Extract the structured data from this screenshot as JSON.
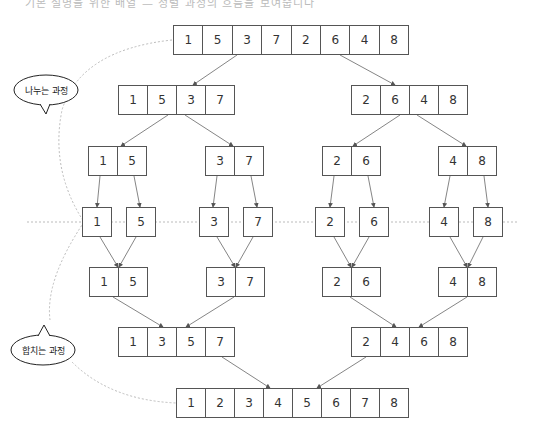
{
  "header_fragment": "기본 설명을 위한 배열 — 정렬 과정의 흐름을 보여줍니다",
  "labels": {
    "divide": "나누는 과정",
    "merge": "합치는 과정"
  },
  "levels": [
    {
      "y": 25,
      "groups": [
        {
          "x": 173,
          "w": 29.4,
          "values": [
            1,
            5,
            3,
            7,
            2,
            6,
            4,
            8
          ]
        }
      ]
    },
    {
      "y": 85,
      "groups": [
        {
          "x": 118,
          "w": 29,
          "values": [
            1,
            5,
            3,
            7
          ]
        },
        {
          "x": 351,
          "w": 29,
          "values": [
            2,
            6,
            4,
            8
          ]
        }
      ]
    },
    {
      "y": 146,
      "groups": [
        {
          "x": 88,
          "w": 29,
          "values": [
            1,
            5
          ]
        },
        {
          "x": 205,
          "w": 29,
          "values": [
            3,
            7
          ]
        },
        {
          "x": 322,
          "w": 29,
          "values": [
            2,
            6
          ]
        },
        {
          "x": 438,
          "w": 29,
          "values": [
            4,
            8
          ]
        }
      ]
    },
    {
      "y": 207,
      "groups": [
        {
          "x": 82,
          "w": 29,
          "values": [
            1
          ]
        },
        {
          "x": 126,
          "w": 29,
          "values": [
            5
          ]
        },
        {
          "x": 199,
          "w": 29,
          "values": [
            3
          ]
        },
        {
          "x": 243,
          "w": 29,
          "values": [
            7
          ]
        },
        {
          "x": 315,
          "w": 29,
          "values": [
            2
          ]
        },
        {
          "x": 359,
          "w": 29,
          "values": [
            6
          ]
        },
        {
          "x": 429,
          "w": 29,
          "values": [
            4
          ]
        },
        {
          "x": 473,
          "w": 29,
          "values": [
            8
          ]
        }
      ]
    },
    {
      "y": 267,
      "groups": [
        {
          "x": 89,
          "w": 29,
          "values": [
            1,
            5
          ]
        },
        {
          "x": 206,
          "w": 29,
          "values": [
            3,
            7
          ]
        },
        {
          "x": 322,
          "w": 29,
          "values": [
            2,
            6
          ]
        },
        {
          "x": 438,
          "w": 29,
          "values": [
            4,
            8
          ]
        }
      ]
    },
    {
      "y": 327,
      "groups": [
        {
          "x": 118,
          "w": 29,
          "values": [
            1,
            3,
            5,
            7
          ]
        },
        {
          "x": 351,
          "w": 29,
          "values": [
            2,
            4,
            6,
            8
          ]
        }
      ]
    },
    {
      "y": 388,
      "groups": [
        {
          "x": 176,
          "w": 29,
          "values": [
            1,
            2,
            3,
            4,
            5,
            6,
            7,
            8
          ]
        }
      ]
    }
  ],
  "cell_height": 30,
  "colors": {
    "border": "#555555",
    "arrow": "#666666",
    "dashed": "#bbbbbb",
    "text": "#333333"
  }
}
